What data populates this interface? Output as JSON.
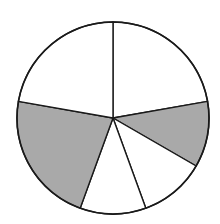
{
  "chart_data": {
    "type": "pie",
    "title": "",
    "start_angle_deg": -90,
    "direction": "clockwise",
    "center": [
      113,
      118
    ],
    "radius": 96,
    "stroke_color": "#1a1a1a",
    "slices": [
      {
        "label": "",
        "fraction": 0.2222,
        "degrees": 80,
        "fill": "#ffffff",
        "shaded": false
      },
      {
        "label": "",
        "fraction": 0.1111,
        "degrees": 40,
        "fill": "#a9a9a9",
        "shaded": true
      },
      {
        "label": "",
        "fraction": 0.1111,
        "degrees": 40,
        "fill": "#ffffff",
        "shaded": false
      },
      {
        "label": "",
        "fraction": 0.1111,
        "degrees": 40,
        "fill": "#ffffff",
        "shaded": false
      },
      {
        "label": "",
        "fraction": 0.2222,
        "degrees": 80,
        "fill": "#a9a9a9",
        "shaded": true
      },
      {
        "label": "",
        "fraction": 0.2222,
        "degrees": 80,
        "fill": "#ffffff",
        "shaded": false
      }
    ],
    "values": [
      2,
      1,
      1,
      1,
      2,
      2
    ],
    "shaded_total_fraction": 0.3333,
    "legend": "none",
    "grid": false
  }
}
